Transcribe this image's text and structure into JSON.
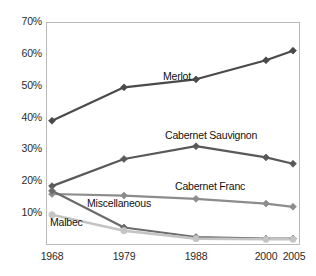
{
  "chart_data": {
    "type": "line",
    "title": "",
    "xlabel": "",
    "ylabel": "",
    "categories": [
      "1968",
      "1979",
      "1988",
      "2000",
      "2005"
    ],
    "x": [
      1968,
      1979,
      1988,
      2000,
      2005
    ],
    "ylim": [
      0,
      70
    ],
    "ytick_labels": [
      "0%",
      "10%",
      "20%",
      "30%",
      "40%",
      "50%",
      "60%",
      "70%"
    ],
    "ytick_values": [
      0,
      10,
      20,
      30,
      40,
      50,
      60,
      70
    ],
    "grid": true,
    "legend": "inline-labels",
    "series": [
      {
        "name": "Merlot",
        "values": [
          39,
          49.5,
          52,
          58,
          61
        ],
        "color": "#4a4a4a",
        "marker": "diamond"
      },
      {
        "name": "Cabernet Sauvignon",
        "values": [
          18.5,
          27,
          31,
          27.5,
          25.5
        ],
        "color": "#595959",
        "marker": "diamond"
      },
      {
        "name": "Cabernet Franc",
        "values": [
          16,
          15.5,
          14.5,
          13,
          12
        ],
        "color": "#8c8c8c",
        "marker": "diamond"
      },
      {
        "name": "Miscellaneous",
        "values": [
          17,
          5.5,
          2.5,
          2,
          2
        ],
        "color": "#6b6b6b",
        "marker": "diamond"
      },
      {
        "name": "Malbec",
        "values": [
          9.5,
          4.5,
          2,
          1.8,
          1.8
        ],
        "color": "#c4c4c4",
        "marker": "circle"
      }
    ],
    "annotations": [
      {
        "text": "Merlot",
        "x": 163,
        "y": 76
      },
      {
        "text": "Cabernet Sauvignon",
        "x": 165,
        "y": 135
      },
      {
        "text": "Cabernet Franc",
        "x": 175,
        "y": 186
      },
      {
        "text": "Miscellaneous",
        "x": 87,
        "y": 203
      },
      {
        "text": "Malbec",
        "x": 50,
        "y": 222
      }
    ]
  },
  "axis": {
    "ytick_labels": [
      "70%",
      "60%",
      "50%",
      "40%",
      "30%",
      "20%",
      "10%"
    ],
    "xtick_labels": [
      "1968",
      "1979",
      "1988",
      "2000",
      "2005"
    ]
  }
}
